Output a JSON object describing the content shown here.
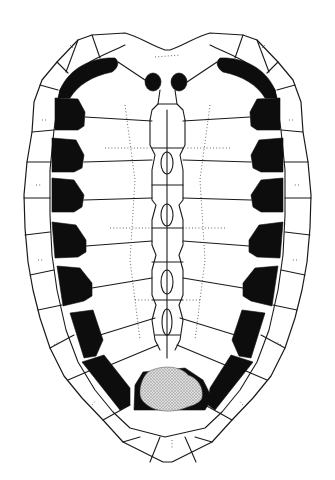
{
  "figure": {
    "colors": {
      "background": "#ffffff",
      "line": "#1a1a1a",
      "dark_pigment": "#0d0d0d",
      "stipple": "#c8c8c8",
      "suture": "#555555"
    },
    "regions": {
      "marginal_scutes_per_side": 12,
      "nuchal_scute": 1,
      "vertebral_column": "central neural series",
      "costal_rows_per_side": 8,
      "peripheral_dark_patches_per_side": 8,
      "nuchal_dark_spots": 2,
      "pygal_region": "stippled"
    }
  }
}
